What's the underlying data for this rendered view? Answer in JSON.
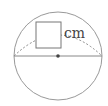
{
  "diagram": {
    "type": "circle-diameter",
    "unit_label": "cm",
    "answer_box": "",
    "elements": [
      "circle",
      "diameter",
      "center-point",
      "dashed-arc",
      "answer-box"
    ],
    "colors": {
      "stroke": "#888888",
      "center": "#444444"
    }
  }
}
